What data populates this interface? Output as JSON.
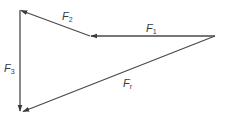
{
  "diagram": {
    "type": "vector-force-polygon",
    "stroke_color": "#4a4a4a",
    "background": "#ffffff",
    "vectors": [
      {
        "id": "F1",
        "symbol": "F",
        "subscript": "1",
        "from": [
          215,
          36
        ],
        "to": [
          90,
          36
        ]
      },
      {
        "id": "F2",
        "symbol": "F",
        "subscript": "2",
        "from": [
          90,
          36
        ],
        "to": [
          20,
          10
        ]
      },
      {
        "id": "F3",
        "symbol": "F",
        "subscript": "3",
        "from": [
          20,
          10
        ],
        "to": [
          20,
          112
        ]
      },
      {
        "id": "Fr",
        "symbol": "F",
        "subscript": "r",
        "from": [
          215,
          36
        ],
        "to": [
          22,
          112
        ]
      }
    ],
    "labels": {
      "f1": {
        "symbol": "F",
        "subscript": "1"
      },
      "f2": {
        "symbol": "F",
        "subscript": "2"
      },
      "f3": {
        "symbol": "F",
        "subscript": "3"
      },
      "fr": {
        "symbol": "F",
        "subscript": "r"
      }
    }
  }
}
